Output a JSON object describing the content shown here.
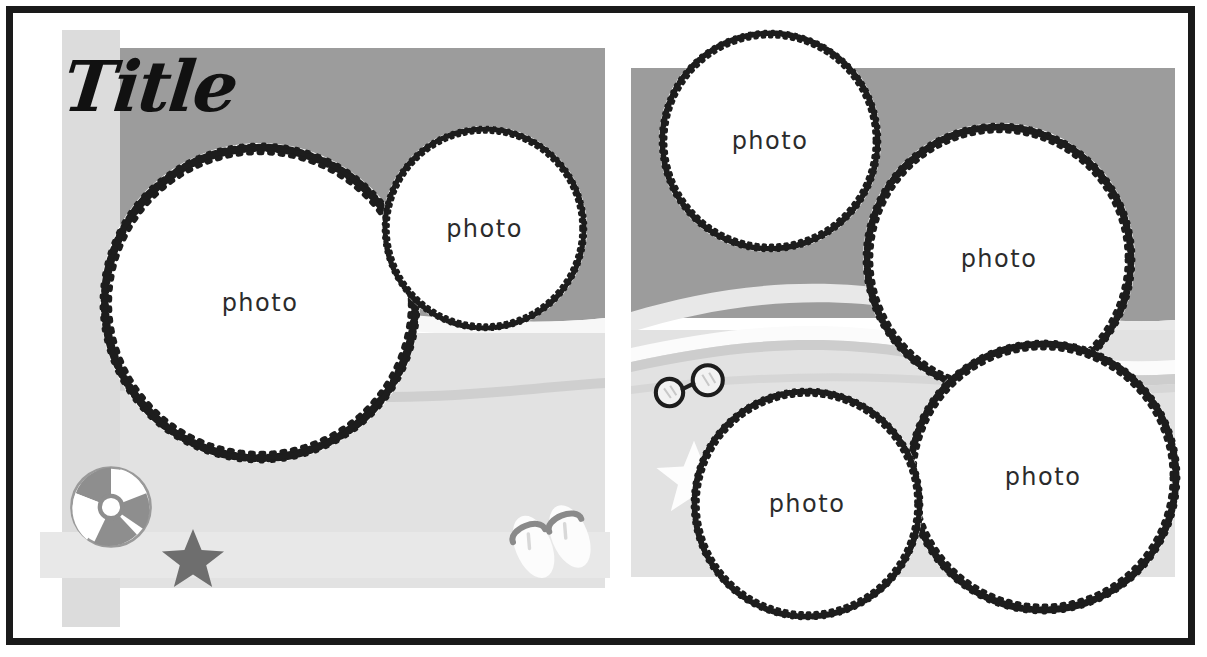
{
  "document": {
    "kind": "scrapbook-layout-sketch",
    "theme": "beach",
    "title_text": "Title",
    "frame_color": "#1a1a1a",
    "page_background": "#ffffff"
  },
  "palette": {
    "sky": "#9c9c9c",
    "water_mid": "#b4b4b4",
    "sand": "#e2e2e2",
    "foam": "#f7f7f7",
    "stripe_light": "#dcdcdc",
    "stripe_band": "#e8e8e8",
    "photo_fill": "#ffffff",
    "ring_stroke": "#1d1d1d",
    "text": "#2b2b2b",
    "accent_dark": "#6e6e6e"
  },
  "pages": [
    {
      "id": "left-page",
      "name": "left-page",
      "photos": [
        {
          "label": "photo",
          "name": "photo-circle-left-large"
        },
        {
          "label": "photo",
          "name": "photo-circle-left-small"
        }
      ],
      "embellishments": [
        {
          "name": "beach-ball-icon",
          "label": "beach ball"
        },
        {
          "name": "star-icon",
          "label": "star"
        },
        {
          "name": "flip-flops-icon",
          "label": "flip flops"
        }
      ]
    },
    {
      "id": "right-page",
      "name": "right-page",
      "photos": [
        {
          "label": "photo",
          "name": "photo-circle-right-top-left"
        },
        {
          "label": "photo",
          "name": "photo-circle-right-top-right"
        },
        {
          "label": "photo",
          "name": "photo-circle-right-bottom-left"
        },
        {
          "label": "photo",
          "name": "photo-circle-right-bottom-right"
        }
      ],
      "embellishments": [
        {
          "name": "sunglasses-icon",
          "label": "sunglasses"
        },
        {
          "name": "star-icon",
          "label": "star"
        }
      ]
    }
  ],
  "labels": {
    "photo": "photo"
  }
}
